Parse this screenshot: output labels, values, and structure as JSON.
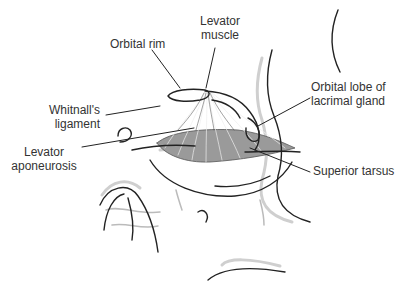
{
  "diagram": {
    "labels": {
      "orbital_rim": "Orbital rim",
      "levator_muscle_l1": "Levator",
      "levator_muscle_l2": "muscle",
      "whitnall_l1": "Whitnall's",
      "whitnall_l2": "ligament",
      "aponeurosis_l1": "Levator",
      "aponeurosis_l2": "aponeurosis",
      "lacrimal_l1": "Orbital lobe of",
      "lacrimal_l2": "lacrimal gland",
      "tarsus": "Superior tarsus"
    },
    "colors": {
      "line": "#222222",
      "shadow": "#c8c8c8",
      "tarsus_fill": "#9a9a9a",
      "text": "#333333"
    }
  }
}
